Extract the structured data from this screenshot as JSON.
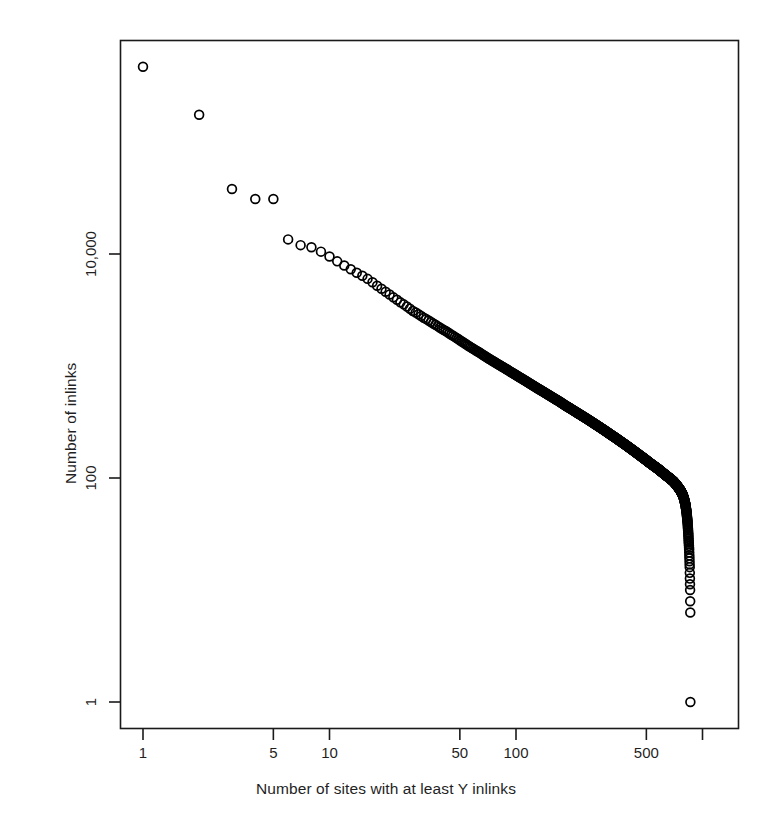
{
  "chart_data": {
    "type": "scatter",
    "title": "",
    "subtitle": "",
    "xlabel": "Number of sites with at least Y inlinks",
    "ylabel": "Number of inlinks",
    "xscale": "log",
    "yscale": "log",
    "grid": false,
    "legend": null,
    "marker": "open-circle",
    "marker_size_px": 10,
    "marker_color": "#000000",
    "xlim": [
      0.86,
      1330
    ],
    "ylim": [
      0.62,
      680000
    ],
    "xticks": [
      1,
      5,
      10,
      50,
      100,
      500,
      1000
    ],
    "xticklabels": [
      "1",
      "5",
      "10",
      "50",
      "100",
      "500",
      ""
    ],
    "yticks": [
      1,
      100,
      10000
    ],
    "yticklabels": [
      "1",
      "100",
      "10,000"
    ],
    "x": [
      1,
      2,
      3,
      4,
      5,
      6,
      7,
      8,
      9,
      10,
      11,
      12,
      13,
      14,
      15,
      16,
      17,
      18,
      19,
      20,
      21,
      22,
      23,
      24,
      25,
      26,
      27,
      28,
      29,
      30,
      32,
      34,
      36,
      38,
      40,
      42,
      44,
      46,
      48,
      50,
      55,
      60,
      65,
      70,
      75,
      80,
      85,
      90,
      95,
      100,
      110,
      120,
      130,
      140,
      150,
      160,
      170,
      180,
      190,
      200,
      220,
      240,
      260,
      280,
      300,
      320,
      340,
      360,
      380,
      400,
      430,
      460,
      490,
      520,
      550,
      580,
      610,
      640,
      670,
      700,
      720,
      740,
      760,
      780,
      795,
      810,
      822,
      832,
      840,
      848,
      854,
      858,
      861
    ],
    "y": [
      470000,
      175000,
      38000,
      31000,
      31000,
      13500,
      12000,
      11500,
      10500,
      9500,
      8600,
      7900,
      7300,
      6800,
      6400,
      6000,
      5600,
      5200,
      4900,
      4600,
      4350,
      4100,
      3900,
      3700,
      3550,
      3400,
      3250,
      3100,
      3000,
      2900,
      2700,
      2550,
      2400,
      2270,
      2150,
      2050,
      1950,
      1860,
      1780,
      1700,
      1530,
      1400,
      1290,
      1190,
      1110,
      1040,
      980,
      925,
      875,
      830,
      755,
      690,
      635,
      590,
      550,
      515,
      485,
      455,
      430,
      408,
      370,
      338,
      310,
      286,
      265,
      246,
      230,
      215,
      202,
      190,
      174,
      160,
      148,
      137,
      128,
      120,
      112,
      105,
      99,
      93,
      88,
      83,
      78,
      72,
      66,
      58,
      49,
      40,
      31,
      23,
      16,
      10,
      5,
      2,
      1
    ]
  },
  "points_note": "Rendered cloud is densified between listed anchors to reproduce the continuous scatter."
}
